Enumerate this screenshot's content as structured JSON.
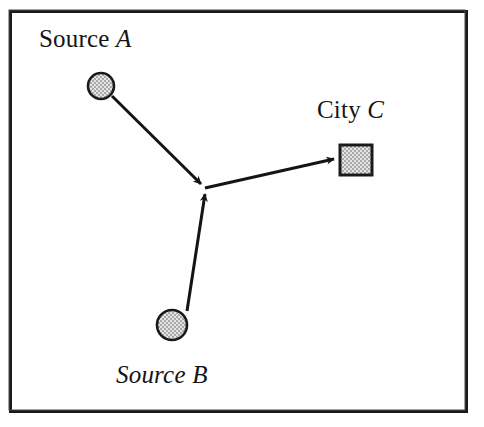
{
  "figure": {
    "type": "node-link-diagram",
    "background_color": "#ffffff",
    "frame": {
      "border_color": "#1a1a1a",
      "x": 9,
      "y": 10,
      "width": 459,
      "height": 403
    },
    "palette": {
      "stroke": "#141414",
      "node_fill": "#c8c8c8",
      "node_outline": "#1a1a1a",
      "text": "#141414"
    },
    "nodes": [
      {
        "id": "source-a",
        "label_roman": "Source",
        "label_italic": "A",
        "label_full": "Source A",
        "shape": "circle",
        "cx": 101,
        "cy": 86,
        "r": 13,
        "fill": "#c8c8c8"
      },
      {
        "id": "source-b",
        "label_roman": "",
        "label_italic": "Source B",
        "label_full": "Source B",
        "shape": "circle",
        "cx": 172,
        "cy": 325,
        "r": 15,
        "fill": "#c8c8c8"
      },
      {
        "id": "city-c",
        "label_roman": "City",
        "label_italic": "C",
        "label_full": "City C",
        "shape": "square",
        "x": 340,
        "y": 145,
        "width": 32,
        "height": 30,
        "fill": "#c8c8c8"
      }
    ],
    "junction": {
      "x": 205,
      "y": 188
    },
    "edges": [
      {
        "id": "edge-a-to-junction",
        "from": "source-a",
        "to": "junction",
        "arrowhead": "at-junction",
        "x1": 112,
        "y1": 96,
        "x2": 205,
        "y2": 188
      },
      {
        "id": "edge-b-to-junction",
        "from": "source-b",
        "to": "junction",
        "arrowhead": "at-junction",
        "x1": 186,
        "y1": 311,
        "x2": 205,
        "y2": 188
      },
      {
        "id": "edge-junction-to-city-c",
        "from": "junction",
        "to": "city-c",
        "arrowhead": "at-city-c",
        "x1": 205,
        "y1": 188,
        "x2": 340,
        "y2": 159
      }
    ],
    "caption_fragment": ""
  }
}
